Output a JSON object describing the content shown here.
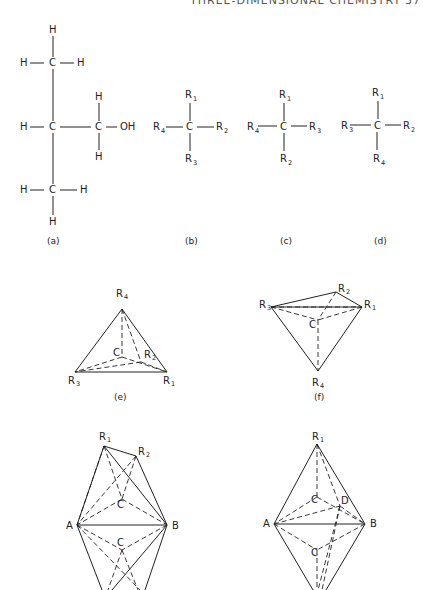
{
  "header": {
    "running_title": "THREE-DIMENSIONAL CHEMISTRY",
    "page_number": "37"
  },
  "figures": {
    "a": {
      "caption": "(a)",
      "atoms": [
        "H",
        "H",
        "H",
        "H",
        "C",
        "C",
        "H",
        "OH",
        "H",
        "H",
        "C",
        "H",
        "H"
      ]
    },
    "b": {
      "caption": "(b)",
      "top": "R1",
      "left": "R4",
      "right": "R2",
      "bottom": "R3",
      "center": "C"
    },
    "c": {
      "caption": "(c)",
      "top": "R1",
      "left": "R4",
      "right": "R3",
      "bottom": "R2",
      "center": "C"
    },
    "d": {
      "caption": "(d)",
      "top": "R1",
      "left": "R3",
      "right": "R2",
      "bottom": "R4",
      "center": "C"
    },
    "e": {
      "caption": "(e)",
      "vertices": [
        "R4",
        "R3",
        "R1",
        "R2"
      ],
      "center": "C"
    },
    "f": {
      "caption": "(f)",
      "vertices": [
        "R3",
        "R2",
        "R1",
        "R4"
      ],
      "center": "C"
    },
    "g": {
      "vertices": [
        "R1",
        "R2",
        "A",
        "B"
      ],
      "centers": [
        "C",
        "C"
      ]
    },
    "h": {
      "vertices": [
        "R1",
        "A",
        "B",
        "D"
      ],
      "centers": [
        "C",
        "C"
      ]
    }
  }
}
